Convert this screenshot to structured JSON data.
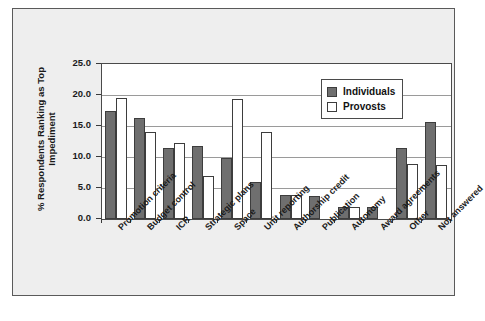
{
  "chart_data": {
    "type": "bar",
    "title": "",
    "xlabel": "",
    "ylabel": "% Respondents Ranking as Top Impediment",
    "ylim": [
      0.0,
      25.0
    ],
    "ytick_step": 5.0,
    "ytick_labels": [
      "0.0",
      "5.0",
      "10.0",
      "15.0",
      "20.0",
      "25.0"
    ],
    "ytick_values": [
      0.0,
      5.0,
      10.0,
      15.0,
      20.0,
      25.0
    ],
    "grid": "horizontal",
    "legend_position": "top-right-inside",
    "xtick_rotation": "-45",
    "categories": [
      "Promotion criteria",
      "Budget control",
      "ICR",
      "Strategic plans",
      "Space",
      "Unit reporting",
      "Authorship credit",
      "Publication",
      "Autonomy",
      "Award agreements",
      "Other",
      "Not answered"
    ],
    "series": [
      {
        "name": "Individuals",
        "color": "#6f6f6f",
        "values": [
          17.4,
          16.3,
          11.5,
          11.8,
          9.9,
          5.9,
          3.9,
          3.7,
          2.0,
          2.0,
          11.5,
          15.7
        ]
      },
      {
        "name": "Provosts",
        "color": "#ffffff",
        "values": [
          19.5,
          14.0,
          12.3,
          7.0,
          19.3,
          14.1,
          3.8,
          0,
          1.9,
          0,
          8.9,
          8.7
        ]
      }
    ]
  },
  "legend": {
    "items": [
      {
        "label": "Individuals"
      },
      {
        "label": "Provosts"
      }
    ]
  },
  "colors": {
    "individuals_fill": "#6f6f6f",
    "provosts_fill": "#ffffff",
    "bar_border": "#3d3d3d",
    "grid": "#9a9a9a",
    "axis": "#4a4a4a",
    "card_background": "#eeeeee",
    "plot_background": "#ffffff"
  }
}
